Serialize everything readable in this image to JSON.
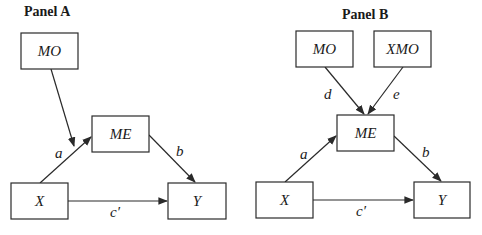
{
  "panels": [
    {
      "title": "Panel A",
      "nodes": {
        "mo": "MO",
        "me": "ME",
        "x": "X",
        "y": "Y"
      },
      "edges": {
        "a": "a",
        "b": "b",
        "c_prime": "c′"
      }
    },
    {
      "title": "Panel B",
      "nodes": {
        "mo": "MO",
        "xmo": "XMO",
        "me": "ME",
        "x": "X",
        "y": "Y"
      },
      "edges": {
        "a": "a",
        "b": "b",
        "c_prime": "c′",
        "d": "d",
        "e": "e"
      }
    }
  ],
  "colors": {
    "line": "#2a2a2a",
    "text": "#1a1a1a",
    "background": "#ffffff"
  }
}
